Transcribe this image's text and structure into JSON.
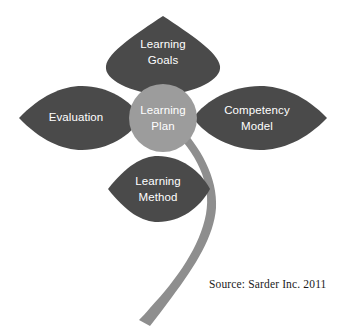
{
  "diagram": {
    "title": "Learning Plan",
    "center": {
      "name": "learning-plan-center",
      "lines": [
        "Learning",
        "Plan"
      ],
      "color": "#9c9c9c",
      "text_color": "#ffffff",
      "cx": 163,
      "cy": 118,
      "r": 34
    },
    "petals": [
      {
        "name": "learning-goals",
        "position": "top",
        "lines": [
          "Learning",
          "Goals"
        ],
        "color": "#4a4a4a",
        "text_color": "#ffffff",
        "label_x": 163,
        "label_y": 50
      },
      {
        "name": "evaluation",
        "position": "left",
        "lines": [
          "Evaluation"
        ],
        "color": "#4a4a4a",
        "text_color": "#ffffff",
        "label_x": 76,
        "label_y": 118
      },
      {
        "name": "competency-model",
        "position": "right",
        "lines": [
          "Competency",
          "Model"
        ],
        "color": "#4a4a4a",
        "text_color": "#ffffff",
        "label_x": 255,
        "label_y": 118
      },
      {
        "name": "learning-method",
        "position": "bottom",
        "lines": [
          "Learning",
          "Method"
        ],
        "color": "#4a4a4a",
        "text_color": "#ffffff",
        "label_x": 158,
        "label_y": 189
      }
    ],
    "stem": {
      "name": "flower-stem",
      "color": "#8e8e8e"
    },
    "background": "#ffffff"
  },
  "source": {
    "text": "Source: Sarder Inc. 2011"
  }
}
